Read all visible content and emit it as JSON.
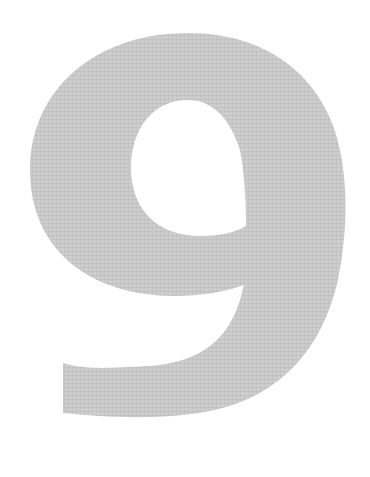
{
  "figure": {
    "character": "9",
    "fill_color": "#c9c9c9",
    "texture_color_light": "#d4d4d4",
    "texture_color_dark": "#bdbdbd",
    "background_color": "#ffffff"
  }
}
